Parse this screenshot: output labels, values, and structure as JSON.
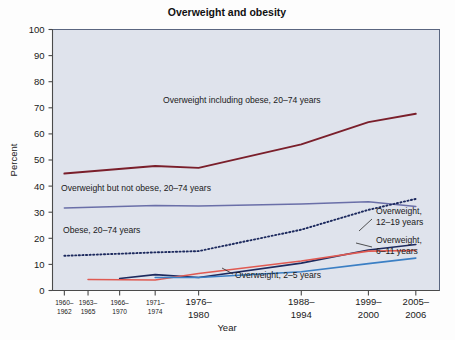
{
  "figure": {
    "background_color": "#fdfdfd",
    "plot_background_color": "#dfe3ec",
    "plot_border_color": "#5a6680"
  },
  "chart_data": {
    "type": "line",
    "title": "Overweight and obesity",
    "xlabel": "Year",
    "ylabel": "Percent",
    "ylim": [
      0,
      100
    ],
    "ytick_step": 10,
    "yticks": [
      0,
      10,
      20,
      30,
      40,
      50,
      60,
      70,
      80,
      90,
      100
    ],
    "grid": false,
    "legend_position": "inline-annotations",
    "categories": [
      "1960–1962",
      "1963–1965",
      "1966–1970",
      "1971–1974",
      "1976–1980",
      "1988–1994",
      "1999–2000",
      "2005–2006"
    ],
    "category_labels": [
      {
        "line1": "1960–",
        "line2": "1962",
        "size": "small"
      },
      {
        "line1": "1963–",
        "line2": "1965",
        "size": "small"
      },
      {
        "line1": "1966–",
        "line2": "1970",
        "size": "small"
      },
      {
        "line1": "1971–",
        "line2": "1974",
        "size": "small"
      },
      {
        "line1": "1976–",
        "line2": "1980",
        "size": "big"
      },
      {
        "line1": "1988–",
        "line2": "1994",
        "size": "big"
      },
      {
        "line1": "1999–",
        "line2": "2000",
        "size": "big"
      },
      {
        "line1": "2005–",
        "line2": "2006",
        "size": "big"
      }
    ],
    "x_positions": [
      1961,
      1964,
      1968,
      1972.5,
      1978,
      1991,
      1999.5,
      2005.5
    ],
    "xlim": [
      1959.5,
      2008.5
    ],
    "series": [
      {
        "name": "Overweight including obese, 20–74 years",
        "color": "#7a1f2b",
        "style": "solid",
        "width": 1.9,
        "x": [
          1961,
          1972.5,
          1978,
          1991,
          1999.5,
          2005.5
        ],
        "values": [
          44.8,
          47.7,
          47.0,
          56.0,
          64.5,
          67.7
        ]
      },
      {
        "name": "Overweight but not obese, 20–74 years",
        "color": "#6a6fa8",
        "style": "solid",
        "width": 1.5,
        "x": [
          1961,
          1972.5,
          1978,
          1991,
          1999.5,
          2005.5
        ],
        "values": [
          31.6,
          32.6,
          32.4,
          33.1,
          34.0,
          32.2
        ]
      },
      {
        "name": "Obese, 20–74 years",
        "color": "#1d2a5e",
        "style": "dotted",
        "width": 1.9,
        "x": [
          1961,
          1972.5,
          1978,
          1991,
          1999.5,
          2005.5
        ],
        "values": [
          13.3,
          14.6,
          15.1,
          23.3,
          30.9,
          35.1
        ]
      },
      {
        "name": "Overweight, 12–19 years",
        "color": "#1d2a5e",
        "style": "solid",
        "width": 1.6,
        "x": [
          1968,
          1972.5,
          1978,
          1991,
          1999.5,
          2005.5
        ],
        "values": [
          4.6,
          6.1,
          5.0,
          10.5,
          15.5,
          17.6
        ]
      },
      {
        "name": "Overweight, 6–11 years",
        "color": "#e05a52",
        "style": "solid",
        "width": 1.6,
        "x": [
          1964,
          1972.5,
          1978,
          1991,
          1999.5,
          2005.5
        ],
        "values": [
          4.2,
          4.0,
          6.5,
          11.3,
          15.1,
          15.3
        ]
      },
      {
        "name": "Overweight, 2–5 years",
        "color": "#3b7fc4",
        "style": "solid",
        "width": 1.6,
        "x": [
          1972.5,
          1978,
          1991,
          1999.5,
          2005.5
        ],
        "values": [
          5.0,
          5.0,
          7.2,
          10.3,
          12.4
        ]
      },
      {
        "name": "Overweight, 6–11 years peak",
        "color": "#e05a52",
        "style": "solid",
        "width": 1.6,
        "x": [
          1999.5,
          2005.5
        ],
        "values": [
          15.1,
          15.3
        ],
        "hidden": true
      }
    ],
    "annotations": [
      {
        "id": "overweight-including-obese",
        "text": "Overweight including obese, 20–74 years",
        "x": 163,
        "y": 103,
        "anchor": "start"
      },
      {
        "id": "overweight-not-obese",
        "text": "Overweight but not obese, 20–74 years",
        "x": 61,
        "y": 191,
        "anchor": "start"
      },
      {
        "id": "obese-20-74",
        "text": "Obese, 20–74 years",
        "x": 63,
        "y": 233,
        "anchor": "start"
      },
      {
        "id": "overweight-12-19-line1",
        "text": "Overweight,",
        "x": 376,
        "y": 214,
        "anchor": "start"
      },
      {
        "id": "overweight-12-19-line2",
        "text": "12–19 years",
        "x": 376,
        "y": 225,
        "anchor": "start"
      },
      {
        "id": "overweight-6-11-line1",
        "text": "Overweight,",
        "x": 376,
        "y": 243,
        "anchor": "start"
      },
      {
        "id": "overweight-6-11-line2",
        "text": "6–11 years",
        "x": 376,
        "y": 254,
        "anchor": "start"
      },
      {
        "id": "overweight-2-5",
        "text": "Overweight, 2–5 years",
        "x": 235,
        "y": 278,
        "anchor": "start"
      }
    ]
  }
}
